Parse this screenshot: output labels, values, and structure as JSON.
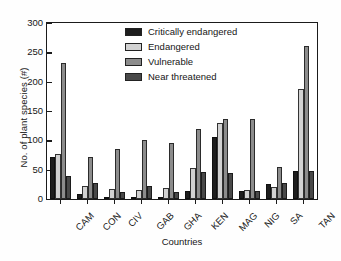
{
  "chart_data": {
    "type": "bar",
    "title": "",
    "subtitle": "",
    "xlabel": "Countries",
    "ylabel": "No. of plant species (#)",
    "ylim": [
      0,
      300
    ],
    "yticks": [
      0,
      50,
      100,
      150,
      200,
      250,
      300
    ],
    "ytick_labels": [
      "0",
      "50",
      "100",
      "150",
      "200",
      "250",
      "300"
    ],
    "grid": false,
    "legend_position": "upper-center-inside",
    "categories": [
      "CAM",
      "CON",
      "CIV",
      "GAB",
      "GHA",
      "KEN",
      "MAG",
      "NIG",
      "SA",
      "TAN"
    ],
    "series": [
      {
        "name": "Critically endangered",
        "color": "#1e1e1e",
        "values": [
          71,
          9,
          1,
          2,
          2,
          14,
          106,
          14,
          25,
          48
        ]
      },
      {
        "name": "Endangered",
        "color": "#d2d2d2",
        "values": [
          77,
          23,
          17,
          15,
          18,
          53,
          129,
          16,
          21,
          187
        ]
      },
      {
        "name": "Vulnerable",
        "color": "#8c8c8c",
        "values": [
          232,
          71,
          85,
          101,
          95,
          120,
          137,
          137,
          55,
          260
        ]
      },
      {
        "name": "Near threatened",
        "color": "#494949",
        "values": [
          39,
          28,
          12,
          22,
          12,
          46,
          44,
          14,
          27,
          48
        ]
      }
    ]
  },
  "legend": {
    "items": [
      {
        "label": "Critically endangered",
        "color": "#1e1e1e"
      },
      {
        "label": "Endangered",
        "color": "#d2d2d2"
      },
      {
        "label": "Vulnerable",
        "color": "#8c8c8c"
      },
      {
        "label": "Near threatened",
        "color": "#494949"
      }
    ]
  },
  "axes": {
    "x_title": "Countries",
    "y_title": "No. of plant species (#)"
  }
}
